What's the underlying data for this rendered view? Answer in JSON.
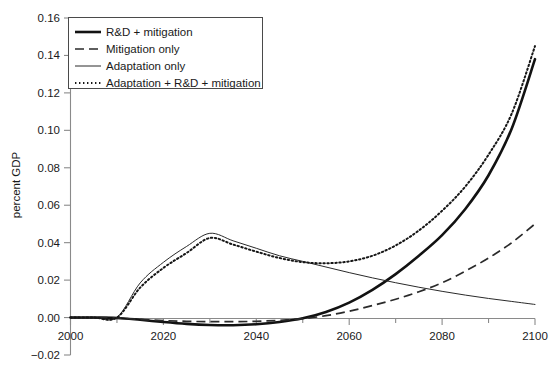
{
  "chart_data": {
    "type": "line",
    "title": "",
    "xlabel": "",
    "ylabel": "percent GDP",
    "xlim": [
      2000,
      2100
    ],
    "ylim": [
      -0.02,
      0.16
    ],
    "xticks": [
      2000,
      2020,
      2040,
      2060,
      2080,
      2100
    ],
    "xtick_labels": [
      "2000",
      "2020",
      "2040",
      "2060",
      "2080",
      "2100"
    ],
    "yticks": [
      -0.02,
      0.0,
      0.02,
      0.04,
      0.06,
      0.08,
      0.1,
      0.12,
      0.14,
      0.16
    ],
    "ytick_labels": [
      "-0.02",
      "0.00",
      "0.02",
      "0.04",
      "0.06",
      "0.08",
      "0.10",
      "0.12",
      "0.14",
      "0.16"
    ],
    "grid": false,
    "legend_position": "upper left",
    "x": [
      2000,
      2005,
      2010,
      2015,
      2020,
      2025,
      2030,
      2035,
      2040,
      2045,
      2050,
      2055,
      2060,
      2065,
      2070,
      2075,
      2080,
      2085,
      2090,
      2095,
      2100
    ],
    "series": [
      {
        "name": "R&D + mitigation",
        "style": "solid-thick",
        "values": [
          0.0,
          0.0,
          -0.0002,
          -0.0012,
          -0.0024,
          -0.0034,
          -0.004,
          -0.0041,
          -0.0036,
          -0.0024,
          -0.0004,
          0.003,
          0.008,
          0.0148,
          0.0232,
          0.033,
          0.044,
          0.058,
          0.076,
          0.101,
          0.138
        ]
      },
      {
        "name": "Mitigation only",
        "style": "dashed",
        "values": [
          0.0,
          0.0,
          -0.0002,
          -0.001,
          -0.0016,
          -0.002,
          -0.0022,
          -0.0022,
          -0.002,
          -0.0015,
          -0.0006,
          0.001,
          0.0034,
          0.0064,
          0.0098,
          0.0138,
          0.0186,
          0.0248,
          0.0318,
          0.04,
          0.05
        ]
      },
      {
        "name": "Adaptation only",
        "style": "solid-thin",
        "values": [
          0.0,
          0.0,
          0.0001,
          0.0185,
          0.0295,
          0.038,
          0.045,
          0.041,
          0.037,
          0.033,
          0.03,
          0.027,
          0.024,
          0.0212,
          0.0186,
          0.0162,
          0.014,
          0.012,
          0.0102,
          0.0086,
          0.007
        ]
      },
      {
        "name": "Adaptation + R&D + mitigation",
        "style": "dotted",
        "values": [
          0.0,
          0.0,
          0.0,
          0.016,
          0.0265,
          0.0345,
          0.0425,
          0.039,
          0.0352,
          0.0318,
          0.0296,
          0.029,
          0.03,
          0.033,
          0.0385,
          0.0465,
          0.057,
          0.07,
          0.087,
          0.109,
          0.145
        ]
      }
    ]
  },
  "legend": {
    "items": [
      {
        "label": "R&D + mitigation",
        "style": "solid-thick"
      },
      {
        "label": "Mitigation only",
        "style": "dashed"
      },
      {
        "label": "Adaptation only",
        "style": "solid-thin"
      },
      {
        "label": "Adaptation + R&D + mitigation",
        "style": "dotted"
      }
    ]
  }
}
